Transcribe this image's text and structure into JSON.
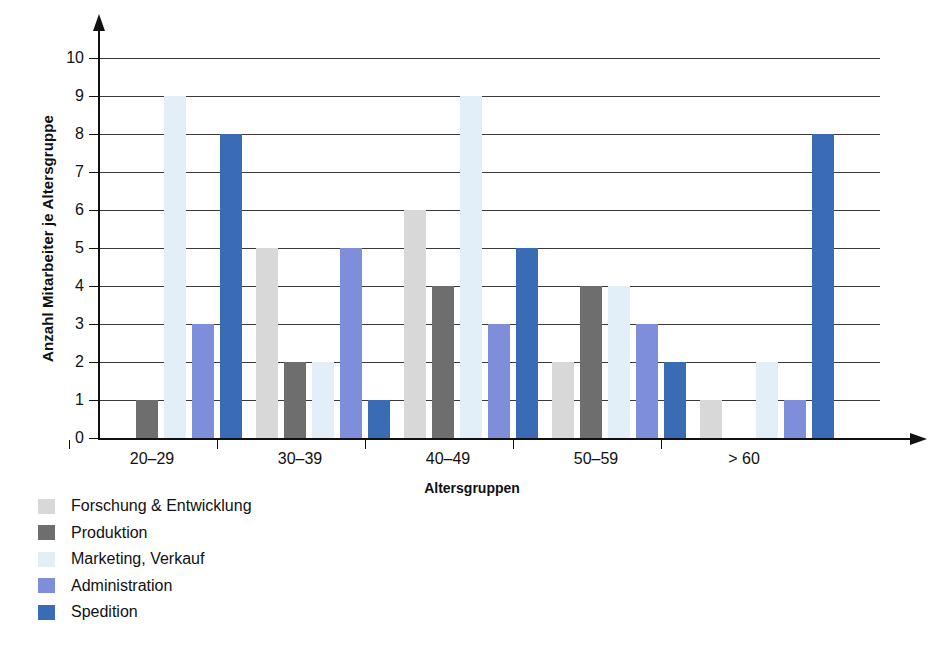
{
  "chart_data": {
    "type": "bar",
    "title": "",
    "subtitle": "",
    "xlabel": "Altersgruppen",
    "ylabel": "Anzahl Mitarbeiter je Altersgruppe",
    "categories": [
      "20–29",
      "30–39",
      "40–49",
      "50–59",
      "> 60"
    ],
    "ylim": [
      0,
      10
    ],
    "yticks": [
      0,
      1,
      2,
      3,
      4,
      5,
      6,
      7,
      8,
      9,
      10
    ],
    "grid": true,
    "legend_position": "below-left",
    "series": [
      {
        "name": "Forschung & Entwicklung",
        "color": "#d8d8d8",
        "values": [
          0,
          5,
          6,
          2,
          1
        ]
      },
      {
        "name": "Produktion",
        "color": "#6e6e6e",
        "values": [
          1,
          2,
          4,
          4,
          0
        ]
      },
      {
        "name": "Marketing, Verkauf",
        "color": "#e3eff8",
        "values": [
          9,
          2,
          9,
          4,
          2
        ]
      },
      {
        "name": "Administration",
        "color": "#7e8edb",
        "values": [
          3,
          5,
          3,
          3,
          1
        ]
      },
      {
        "name": "Spedition",
        "color": "#3a6cb5",
        "values": [
          8,
          1,
          5,
          2,
          8
        ]
      }
    ]
  },
  "axis": {
    "y_tick_labels": [
      "0",
      "1",
      "2",
      "3",
      "4",
      "5",
      "6",
      "7",
      "8",
      "9",
      "10"
    ],
    "x_axis_title": "Altersgruppen",
    "y_axis_title": "Anzahl Mitarbeiter je Altersgruppe"
  },
  "legend": {
    "items": [
      {
        "label": "Forschung & Entwicklung",
        "color": "#d8d8d8"
      },
      {
        "label": "Produktion",
        "color": "#6e6e6e"
      },
      {
        "label": "Marketing, Verkauf",
        "color": "#e3eff8"
      },
      {
        "label": "Administration",
        "color": "#7e8edb"
      },
      {
        "label": "Spedition",
        "color": "#3a6cb5"
      }
    ]
  }
}
